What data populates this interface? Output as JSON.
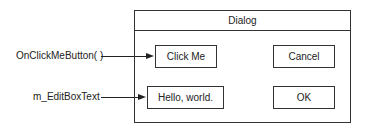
{
  "annotations": [
    {
      "label": "OnClickMeButton( )",
      "target": "click_me"
    },
    {
      "label": "m_EditBoxText",
      "target": "edit_box"
    }
  ],
  "dialog": {
    "title": "Dialog",
    "controls": {
      "click_me": "Click Me",
      "cancel": "Cancel",
      "edit_box": "Hello, world.",
      "ok": "OK"
    }
  }
}
